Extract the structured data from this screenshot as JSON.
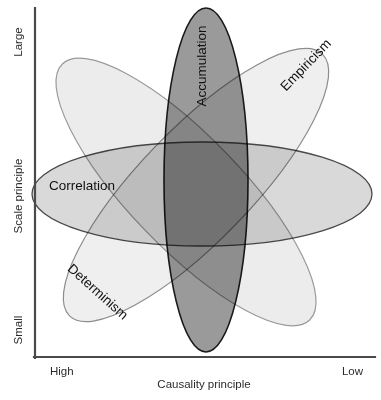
{
  "diagram": {
    "background_color": "#ffffff"
  },
  "axes": {
    "x": {
      "label": "Causality principle",
      "left_tick": "High",
      "right_tick": "Low",
      "line_color": "#4a4a4a"
    },
    "y": {
      "label": "Scale principle",
      "top_tick": "Large",
      "bottom_tick": "Small",
      "line_color": "#4a4a4a"
    }
  },
  "ellipses": [
    {
      "id": "accumulation",
      "label": "Accumulation",
      "fill": "#9a9a9a",
      "stroke": "#1a1a1a",
      "cx": 206,
      "cy": 180,
      "rx": 42,
      "ry": 172,
      "rotate": 0,
      "label_x": 206,
      "label_y": 66,
      "label_rotate": -90
    },
    {
      "id": "empiricism",
      "label": "Empiricism",
      "fill": "#efefef",
      "stroke": "#8d8d8d",
      "cx": 196,
      "cy": 185,
      "rx": 182,
      "ry": 56,
      "rotate": -46,
      "label_x": 309,
      "label_y": 68,
      "label_rotate": -46
    },
    {
      "id": "determinism",
      "label": "Determinism",
      "fill": "#ececec",
      "stroke": "#9a9a9a",
      "cx": 186,
      "cy": 192,
      "rx": 178,
      "ry": 56,
      "rotate": 46,
      "label_x": 95,
      "label_y": 295,
      "label_rotate": 42
    },
    {
      "id": "correlation",
      "label": "Correlation",
      "fill": "#d9d9d9",
      "stroke": "#4a4a4a",
      "cx": 202,
      "cy": 194,
      "rx": 170,
      "ry": 52,
      "rotate": 0,
      "label_x": 82,
      "label_y": 190,
      "label_rotate": 0
    }
  ]
}
